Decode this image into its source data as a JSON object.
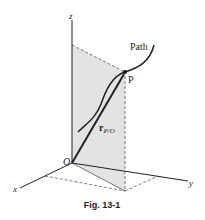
{
  "figure": {
    "caption": "Fig. 13-1",
    "labels": {
      "z_axis": "z",
      "x_axis": "x",
      "y_axis": "y",
      "origin": "O",
      "point": "P",
      "path": "Path",
      "position_vector": "r",
      "position_vector_subscript": "P/O"
    },
    "colors": {
      "plane_fill": "#e3e3e3",
      "line": "#222222",
      "dashed": "#555555"
    }
  }
}
